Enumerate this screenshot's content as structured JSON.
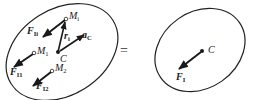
{
  "diagram": {
    "type": "rigid-body-inertia-force-equivalence",
    "equals_sign": "=",
    "left_body": {
      "points": [
        {
          "id": "Mi",
          "label": "M",
          "sub": "i"
        },
        {
          "id": "M1",
          "label": "M",
          "sub": "1"
        },
        {
          "id": "M2",
          "label": "M",
          "sub": "2"
        },
        {
          "id": "C",
          "label": "C",
          "sub": ""
        }
      ],
      "vectors": [
        {
          "id": "FIi",
          "label": "F",
          "sub": "Ii",
          "bold": true
        },
        {
          "id": "FI1",
          "label": "F",
          "sub": "I1",
          "bold": true
        },
        {
          "id": "FI2",
          "label": "F",
          "sub": "I2",
          "bold": true
        },
        {
          "id": "ri",
          "label": "r",
          "sub": "i",
          "bold": true
        },
        {
          "id": "aC",
          "label": "a",
          "sub": "C",
          "bold": true
        }
      ]
    },
    "right_body": {
      "points": [
        {
          "id": "C",
          "label": "C",
          "sub": ""
        }
      ],
      "vectors": [
        {
          "id": "FI",
          "label": "F",
          "sub": "I",
          "bold": true
        }
      ]
    }
  }
}
